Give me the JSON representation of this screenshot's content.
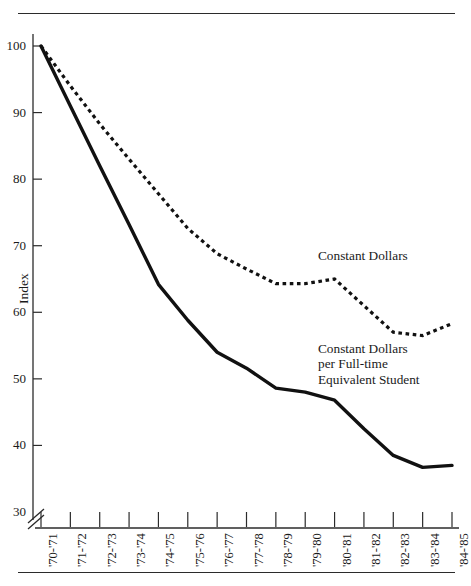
{
  "chart_data": {
    "type": "line",
    "title": "",
    "xlabel": "",
    "ylabel": "Index",
    "ylim": [
      30,
      100
    ],
    "yticks": [
      30,
      40,
      50,
      60,
      70,
      80,
      90,
      100
    ],
    "ytick_labels": [
      "30",
      "40",
      "50",
      "60",
      "70",
      "80",
      "90",
      "100"
    ],
    "y_axis_break": true,
    "y_axis_break_note": "axis break between 0 and 30",
    "grid": false,
    "legend_position": "inline annotations at right of plot",
    "categories": [
      "'70-'71",
      "'71-'72",
      "'72-'73",
      "'73-'74",
      "'74-'75",
      "'75-'76",
      "'76-'77",
      "'77-'78",
      "'78-'79",
      "'79-'80",
      "'80-'81",
      "'81-'82",
      "'82-'83",
      "'83-'84",
      "'84-'85"
    ],
    "series": [
      {
        "name": "Constant Dollars",
        "style": "dotted",
        "values": [
          100,
          94,
          88.3,
          83,
          77.8,
          72.6,
          68.8,
          66.5,
          64.3,
          64.3,
          65,
          61,
          57,
          56.5,
          58.3
        ]
      },
      {
        "name": "Constant Dollars per Full-time Equivalent Student",
        "style": "solid",
        "values": [
          100,
          91,
          82,
          73.2,
          64.2,
          58.8,
          54,
          51.6,
          48.6,
          48,
          46.8,
          42.5,
          38.5,
          36.7,
          37
        ]
      }
    ],
    "annotations": [
      {
        "id": "constant-dollars",
        "text": "Constant Dollars"
      },
      {
        "id": "constant-dollars-fte",
        "text": "Constant Dollars\nper Full-time\nEquivalent Student"
      }
    ],
    "colors": {
      "line": "#111111",
      "axis": "#2b2b2b",
      "background": "#ffffff"
    }
  }
}
